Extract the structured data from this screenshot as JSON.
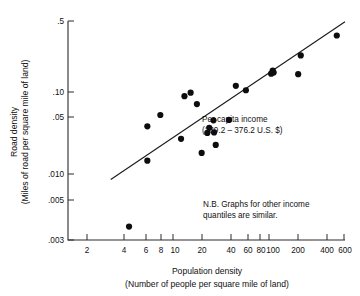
{
  "chart_data": {
    "type": "scatter",
    "title": "",
    "xlabel": "Population density",
    "xlabel_sub": "(Number of people per square mile of land)",
    "ylabel": "Road density",
    "ylabel_sub": "(Miles of road per square mile of land)",
    "xscale": "log",
    "yscale": "log",
    "xlim": [
      1.55,
      720
    ],
    "ylim": [
      0.0029,
      0.56
    ],
    "grid": false,
    "legend": "none",
    "xticks": [
      2,
      4,
      6,
      8,
      10,
      20,
      40,
      60,
      80,
      100,
      200,
      400,
      600
    ],
    "xtick_labels": [
      "2",
      "4",
      "6",
      "8",
      "10",
      "20",
      "40",
      "60",
      "80",
      "100",
      "200",
      "400",
      "600"
    ],
    "yticks": [
      0.003,
      0.005,
      0.01,
      0.05,
      0.1,
      0.5
    ],
    "ytick_labels": [
      ".003",
      ".005",
      ".010",
      ".05",
      ".10",
      ".5"
    ],
    "points": [
      {
        "x": 6.0,
        "y": 0.004
      },
      {
        "x": 9.0,
        "y": 0.0195
      },
      {
        "x": 9.0,
        "y": 0.0445
      },
      {
        "x": 12.0,
        "y": 0.0585
      },
      {
        "x": 19.0,
        "y": 0.033
      },
      {
        "x": 20.5,
        "y": 0.092
      },
      {
        "x": 23.5,
        "y": 0.1
      },
      {
        "x": 27.0,
        "y": 0.076
      },
      {
        "x": 30.0,
        "y": 0.0235
      },
      {
        "x": 34.0,
        "y": 0.038
      },
      {
        "x": 35.5,
        "y": 0.043
      },
      {
        "x": 39.0,
        "y": 0.0515
      },
      {
        "x": 39.5,
        "y": 0.0385
      },
      {
        "x": 41.0,
        "y": 0.0285
      },
      {
        "x": 55.0,
        "y": 0.052
      },
      {
        "x": 64.0,
        "y": 0.118
      },
      {
        "x": 80.0,
        "y": 0.106
      },
      {
        "x": 140.0,
        "y": 0.158
      },
      {
        "x": 145.0,
        "y": 0.17
      },
      {
        "x": 148.0,
        "y": 0.162
      },
      {
        "x": 255.0,
        "y": 0.156
      },
      {
        "x": 270.0,
        "y": 0.245
      },
      {
        "x": 600.0,
        "y": 0.395
      }
    ],
    "trendline": {
      "x0": 4.0,
      "y0": 0.0124,
      "x1": 720.0,
      "y1": 0.55
    },
    "annotations": [
      {
        "name": "per-capita-income-note",
        "line1": "Per capita income",
        "line2": "(239.2 – 376.2 U.S. $)"
      },
      {
        "name": "quantiles-note",
        "line1": "N.B. Graphs for other income",
        "line2": "quantiles are similar."
      }
    ]
  }
}
